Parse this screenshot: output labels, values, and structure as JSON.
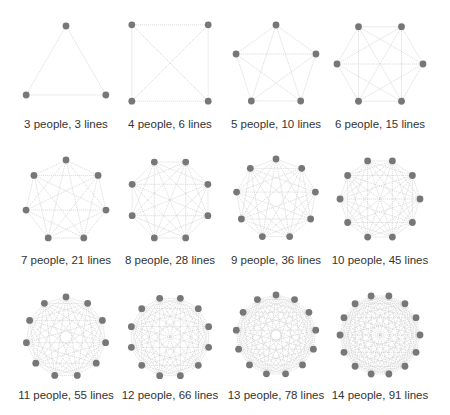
{
  "colors": {
    "background": "#ffffff",
    "node": "#777777",
    "edge": "#c8c8c8",
    "label": "#333333"
  },
  "figures": [
    {
      "people": 3,
      "lines": 3,
      "label": "3 people, 3 lines",
      "cx": 66,
      "cy": 72,
      "r": 46,
      "rot": -90
    },
    {
      "people": 4,
      "lines": 6,
      "label": "4 people, 6 lines",
      "cx": 170,
      "cy": 63,
      "r": 54,
      "rot": -135
    },
    {
      "people": 5,
      "lines": 10,
      "label": "5 people, 10 lines",
      "cx": 276,
      "cy": 67,
      "r": 42,
      "rot": -90
    },
    {
      "people": 6,
      "lines": 15,
      "label": "6 people, 15 lines",
      "cx": 380,
      "cy": 64,
      "r": 43,
      "rot": -120
    },
    {
      "people": 7,
      "lines": 21,
      "label": "7 people, 21 lines",
      "cx": 66,
      "cy": 201,
      "r": 41,
      "rot": -90
    },
    {
      "people": 8,
      "lines": 28,
      "label": "8 people, 28 lines",
      "cx": 170,
      "cy": 200,
      "r": 41,
      "rot": -112.5
    },
    {
      "people": 9,
      "lines": 36,
      "label": "9 people, 36 lines",
      "cx": 276,
      "cy": 199,
      "r": 40,
      "rot": -90
    },
    {
      "people": 10,
      "lines": 45,
      "label": "10 people, 45 lines",
      "cx": 380,
      "cy": 199,
      "r": 40,
      "rot": -108
    },
    {
      "people": 11,
      "lines": 55,
      "label": "11 people, 55 lines",
      "cx": 66,
      "cy": 337,
      "r": 40,
      "rot": -90
    },
    {
      "people": 12,
      "lines": 66,
      "label": "12 people, 66 lines",
      "cx": 170,
      "cy": 337,
      "r": 40,
      "rot": -105
    },
    {
      "people": 13,
      "lines": 78,
      "label": "13 people, 78 lines",
      "cx": 276,
      "cy": 335,
      "r": 40,
      "rot": -90
    },
    {
      "people": 14,
      "lines": 91,
      "label": "14 people, 91 lines",
      "cx": 380,
      "cy": 335,
      "r": 40,
      "rot": -102.86
    }
  ],
  "label_rows_y": [
    118,
    254,
    389
  ]
}
